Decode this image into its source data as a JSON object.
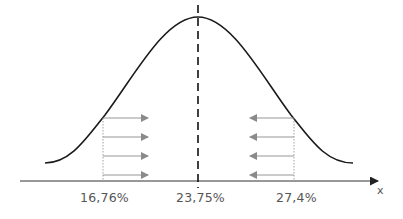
{
  "diagram": {
    "type": "normal-distribution",
    "axis_label": "x",
    "mean_label": "23,75%",
    "left_bound_label": "16,76%",
    "right_bound_label": "27,4%",
    "arrows_per_side": 4,
    "colors": {
      "curve": "#1a1a1a",
      "axis": "#333333",
      "arrows": "#8a8a8a",
      "text": "#555555"
    }
  }
}
